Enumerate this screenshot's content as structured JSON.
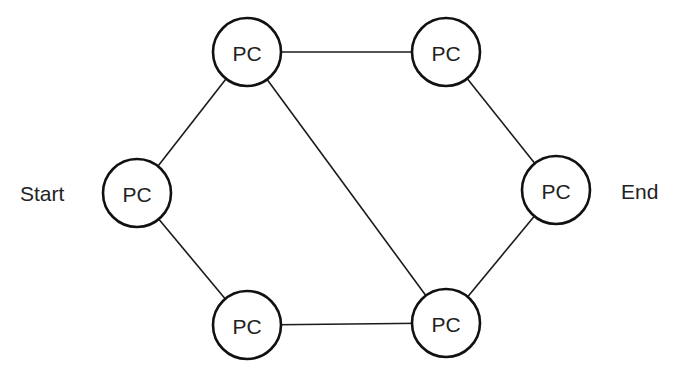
{
  "diagram": {
    "type": "network-graph",
    "labels": {
      "start": "Start",
      "end": "End"
    },
    "nodes": [
      {
        "id": "left",
        "label": "PC",
        "cx": 137,
        "cy": 193
      },
      {
        "id": "top-left",
        "label": "PC",
        "cx": 247,
        "cy": 52
      },
      {
        "id": "top-right",
        "label": "PC",
        "cx": 446,
        "cy": 52
      },
      {
        "id": "right",
        "label": "PC",
        "cx": 556,
        "cy": 190
      },
      {
        "id": "bottom-left",
        "label": "PC",
        "cx": 247,
        "cy": 325
      },
      {
        "id": "bottom-right",
        "label": "PC",
        "cx": 446,
        "cy": 323
      }
    ],
    "edges": [
      {
        "from": "left",
        "to": "top-left"
      },
      {
        "from": "left",
        "to": "bottom-left"
      },
      {
        "from": "top-left",
        "to": "top-right"
      },
      {
        "from": "top-left",
        "to": "bottom-right"
      },
      {
        "from": "bottom-left",
        "to": "bottom-right"
      },
      {
        "from": "top-right",
        "to": "right"
      },
      {
        "from": "bottom-right",
        "to": "right"
      }
    ],
    "node_radius": 34,
    "colors": {
      "stroke": "#111111",
      "text": "#222222",
      "background": "#ffffff"
    }
  }
}
